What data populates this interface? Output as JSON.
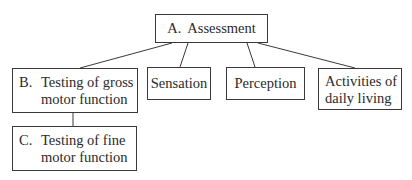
{
  "diagram": {
    "type": "hierarchy",
    "nodes": {
      "A": {
        "letter": "A.",
        "label": "Assessment"
      },
      "B": {
        "letter": "B.",
        "line1": "Testing of gross",
        "line2": "motor function"
      },
      "sensation": {
        "label": "Sensation"
      },
      "perception": {
        "label": "Perception"
      },
      "adl": {
        "line1": "Activities of",
        "line2": "daily living"
      },
      "C": {
        "letter": "C.",
        "line1": "Testing of fine",
        "line2": "motor function"
      }
    },
    "edges": [
      [
        "A",
        "B"
      ],
      [
        "A",
        "sensation"
      ],
      [
        "A",
        "perception"
      ],
      [
        "A",
        "adl"
      ],
      [
        "B",
        "C"
      ]
    ],
    "colors": {
      "line": "#3a3a3a",
      "background": "#ffffff",
      "text": "#2a2a2a"
    }
  }
}
